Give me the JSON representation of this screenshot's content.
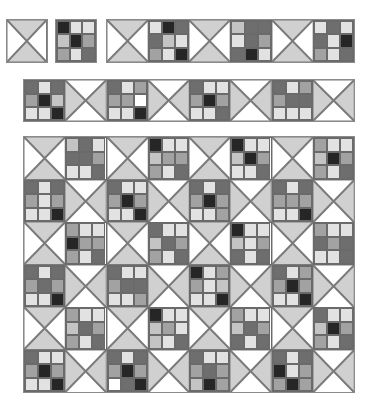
{
  "palette": {
    "W": "#ffffff",
    "L": "#e2e2e2",
    "M": "#c4c4c4",
    "G": "#a2a2a2",
    "D": "#6e6e6e",
    "K": "#262626",
    "tri": "#d0d0d0",
    "line": "#7a7a7a"
  },
  "block_size": 41.5,
  "rows": [
    {
      "name": "row-1-single-hourglass",
      "x": 6,
      "y": 19,
      "h": 44,
      "blocks": [
        {
          "type": "hourglass",
          "orient": "v"
        }
      ]
    },
    {
      "name": "row-1-single-ninepatch",
      "x": 55,
      "y": 19,
      "h": 44,
      "blocks": [
        {
          "type": "nine",
          "cells": [
            "K",
            "L",
            "L",
            "M",
            "K",
            "G",
            "G",
            "L",
            "D"
          ]
        }
      ]
    },
    {
      "name": "row-1-strip",
      "x": 106,
      "y": 19,
      "h": 44,
      "blocks": [
        {
          "type": "hourglass",
          "orient": "v"
        },
        {
          "type": "nine",
          "cells": [
            "L",
            "K",
            "D",
            "D",
            "M",
            "L",
            "G",
            "L",
            "K"
          ]
        },
        {
          "type": "hourglass",
          "orient": "v"
        },
        {
          "type": "nine",
          "cells": [
            "M",
            "D",
            "D",
            "L",
            "D",
            "G",
            "D",
            "K",
            "L"
          ]
        },
        {
          "type": "hourglass",
          "orient": "v"
        },
        {
          "type": "nine",
          "cells": [
            "L",
            "D",
            "L",
            "D",
            "L",
            "K",
            "G",
            "L",
            "D"
          ]
        }
      ]
    },
    {
      "name": "row-2-strip",
      "x": 23,
      "y": 79,
      "h": 43,
      "blocks": [
        {
          "type": "nine",
          "cells": [
            "D",
            "L",
            "D",
            "G",
            "K",
            "M",
            "L",
            "L",
            "K"
          ]
        },
        {
          "type": "hourglass",
          "orient": "h"
        },
        {
          "type": "nine",
          "cells": [
            "D",
            "L",
            "G",
            "G",
            "G",
            "W",
            "L",
            "L",
            "K"
          ]
        },
        {
          "type": "hourglass",
          "orient": "h"
        },
        {
          "type": "nine",
          "cells": [
            "D",
            "L",
            "L",
            "G",
            "K",
            "G",
            "L",
            "L",
            "D"
          ]
        },
        {
          "type": "hourglass",
          "orient": "h"
        },
        {
          "type": "nine",
          "cells": [
            "D",
            "L",
            "G",
            "G",
            "D",
            "D",
            "L",
            "L",
            "L"
          ]
        },
        {
          "type": "hourglass",
          "orient": "h"
        }
      ]
    }
  ],
  "quilt": {
    "x": 23,
    "y": 136,
    "w": 332,
    "h": 257,
    "cols": 8,
    "rows": [
      [
        {
          "type": "hourglass",
          "orient": "v"
        },
        {
          "type": "nine",
          "cells": [
            "M",
            "D",
            "L",
            "D",
            "D",
            "G",
            "L",
            "L",
            "D"
          ]
        },
        {
          "type": "hourglass",
          "orient": "v"
        },
        {
          "type": "nine",
          "cells": [
            "K",
            "L",
            "L",
            "M",
            "G",
            "G",
            "G",
            "L",
            "D"
          ]
        },
        {
          "type": "hourglass",
          "orient": "v"
        },
        {
          "type": "nine",
          "cells": [
            "K",
            "L",
            "L",
            "M",
            "K",
            "G",
            "L",
            "L",
            "D"
          ]
        },
        {
          "type": "hourglass",
          "orient": "v"
        },
        {
          "type": "nine",
          "cells": [
            "G",
            "L",
            "L",
            "M",
            "K",
            "G",
            "G",
            "L",
            "D"
          ]
        }
      ],
      [
        {
          "type": "nine",
          "cells": [
            "D",
            "L",
            "D",
            "G",
            "L",
            "G",
            "L",
            "L",
            "K"
          ]
        },
        {
          "type": "hourglass",
          "orient": "h"
        },
        {
          "type": "nine",
          "cells": [
            "D",
            "L",
            "L",
            "G",
            "K",
            "G",
            "L",
            "L",
            "K"
          ]
        },
        {
          "type": "hourglass",
          "orient": "h"
        },
        {
          "type": "nine",
          "cells": [
            "D",
            "L",
            "D",
            "G",
            "K",
            "G",
            "L",
            "L",
            "G"
          ]
        },
        {
          "type": "hourglass",
          "orient": "h"
        },
        {
          "type": "nine",
          "cells": [
            "D",
            "L",
            "D",
            "G",
            "G",
            "G",
            "L",
            "L",
            "K"
          ]
        },
        {
          "type": "hourglass",
          "orient": "h"
        }
      ],
      [
        {
          "type": "hourglass",
          "orient": "v"
        },
        {
          "type": "nine",
          "cells": [
            "G",
            "L",
            "L",
            "K",
            "G",
            "G",
            "G",
            "L",
            "D"
          ]
        },
        {
          "type": "hourglass",
          "orient": "v"
        },
        {
          "type": "nine",
          "cells": [
            "D",
            "L",
            "L",
            "M",
            "D",
            "G",
            "G",
            "L",
            "D"
          ]
        },
        {
          "type": "hourglass",
          "orient": "v"
        },
        {
          "type": "nine",
          "cells": [
            "K",
            "L",
            "L",
            "M",
            "L",
            "G",
            "D",
            "L",
            "D"
          ]
        },
        {
          "type": "hourglass",
          "orient": "v"
        },
        {
          "type": "nine",
          "cells": [
            "G",
            "L",
            "L",
            "D",
            "G",
            "D",
            "L",
            "L",
            "D"
          ]
        }
      ],
      [
        {
          "type": "nine",
          "cells": [
            "D",
            "L",
            "D",
            "G",
            "D",
            "G",
            "L",
            "L",
            "K"
          ]
        },
        {
          "type": "hourglass",
          "orient": "h"
        },
        {
          "type": "nine",
          "cells": [
            "D",
            "L",
            "L",
            "G",
            "D",
            "D",
            "L",
            "L",
            "G"
          ]
        },
        {
          "type": "hourglass",
          "orient": "h"
        },
        {
          "type": "nine",
          "cells": [
            "K",
            "L",
            "G",
            "G",
            "L",
            "M",
            "L",
            "L",
            "K"
          ]
        },
        {
          "type": "hourglass",
          "orient": "h"
        },
        {
          "type": "nine",
          "cells": [
            "D",
            "L",
            "G",
            "G",
            "K",
            "G",
            "L",
            "L",
            "K"
          ]
        },
        {
          "type": "hourglass",
          "orient": "h"
        }
      ],
      [
        {
          "type": "hourglass",
          "orient": "v"
        },
        {
          "type": "nine",
          "cells": [
            "G",
            "L",
            "L",
            "M",
            "D",
            "G",
            "G",
            "L",
            "D"
          ]
        },
        {
          "type": "hourglass",
          "orient": "v"
        },
        {
          "type": "nine",
          "cells": [
            "K",
            "L",
            "L",
            "M",
            "G",
            "L",
            "M",
            "L",
            "D"
          ]
        },
        {
          "type": "hourglass",
          "orient": "v"
        },
        {
          "type": "nine",
          "cells": [
            "G",
            "L",
            "L",
            "M",
            "D",
            "G",
            "D",
            "L",
            "D"
          ]
        },
        {
          "type": "hourglass",
          "orient": "v"
        },
        {
          "type": "nine",
          "cells": [
            "D",
            "L",
            "L",
            "M",
            "K",
            "G",
            "G",
            "L",
            "D"
          ]
        }
      ],
      [
        {
          "type": "nine",
          "cells": [
            "D",
            "L",
            "L",
            "G",
            "K",
            "G",
            "L",
            "L",
            "K"
          ]
        },
        {
          "type": "hourglass",
          "orient": "h"
        },
        {
          "type": "nine",
          "cells": [
            "D",
            "L",
            "D",
            "G",
            "K",
            "G",
            "W",
            "D",
            "K"
          ]
        },
        {
          "type": "hourglass",
          "orient": "h"
        },
        {
          "type": "nine",
          "cells": [
            "D",
            "L",
            "L",
            "G",
            "D",
            "G",
            "M",
            "K",
            "G"
          ]
        },
        {
          "type": "hourglass",
          "orient": "h"
        },
        {
          "type": "nine",
          "cells": [
            "D",
            "L",
            "D",
            "K",
            "L",
            "G",
            "G",
            "K",
            "G"
          ]
        },
        {
          "type": "hourglass",
          "orient": "h"
        }
      ]
    ]
  }
}
